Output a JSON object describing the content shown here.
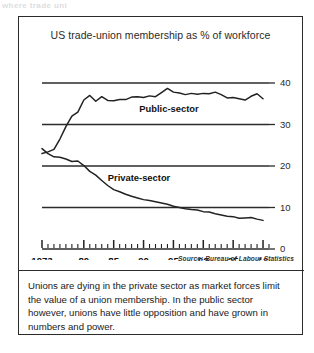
{
  "top_bleed_text": "where trade uni",
  "figure": {
    "title": "US trade-union membership as % of workforce",
    "source": "Source: Bureau of Labour Statistics",
    "caption": "Unions are dying in the private sector as market forces limit the value of a union membership. In the public sector however, unions have little opposition and have grown in numbers and power."
  },
  "colors": {
    "line": "#222222",
    "gridline": "#2b2b2b",
    "text": "#1a1a1a",
    "border": "#2b2b2b",
    "background": "#ffffff"
  },
  "chart_data": {
    "type": "line",
    "title": "US trade-union membership as % of workforce",
    "xlabel": "",
    "ylabel": "",
    "xlim": [
      1973,
      2011
    ],
    "ylim": [
      0,
      42
    ],
    "yticks": [
      0,
      10,
      20,
      30,
      40
    ],
    "ytick_labels": [
      "0",
      "10",
      "20",
      "30",
      "40"
    ],
    "grid": "horizontal-gridlines-at-yticks",
    "xticks_major": [
      1973,
      1980,
      1985,
      1990,
      1995,
      2000,
      2005,
      2010
    ],
    "xtick_labels": [
      "1973",
      "80",
      "85",
      "90",
      "95",
      "00",
      "05",
      "10"
    ],
    "xticks_minor_step": 1,
    "legend": "inline-labels",
    "series": [
      {
        "name": "Public-sector",
        "label_position": "inside-right-of-center",
        "x": [
          1973,
          1974,
          1975,
          1976,
          1977,
          1978,
          1979,
          1980,
          1981,
          1982,
          1983,
          1984,
          1985,
          1986,
          1987,
          1988,
          1989,
          1990,
          1991,
          1992,
          1993,
          1994,
          1995,
          1996,
          1997,
          1998,
          1999,
          2000,
          2001,
          2002,
          2003,
          2004,
          2005,
          2006,
          2007,
          2008,
          2009,
          2010
        ],
        "values": [
          23.0,
          23.4,
          24.0,
          26.5,
          29.5,
          32.0,
          33.0,
          35.9,
          37.0,
          35.6,
          36.7,
          35.8,
          35.7,
          36.0,
          36.0,
          36.6,
          36.7,
          36.5,
          36.9,
          36.7,
          37.7,
          38.7,
          37.8,
          37.6,
          37.2,
          37.5,
          37.3,
          37.5,
          37.4,
          37.8,
          37.2,
          36.4,
          36.5,
          36.2,
          35.9,
          36.8,
          37.4,
          36.2
        ]
      },
      {
        "name": "Private-sector",
        "label_position": "left-of-center",
        "x": [
          1973,
          1974,
          1975,
          1976,
          1977,
          1978,
          1979,
          1980,
          1981,
          1982,
          1983,
          1984,
          1985,
          1986,
          1987,
          1988,
          1989,
          1990,
          1991,
          1992,
          1993,
          1994,
          1995,
          1996,
          1997,
          1998,
          1999,
          2000,
          2001,
          2002,
          2003,
          2004,
          2005,
          2006,
          2007,
          2008,
          2009,
          2010
        ],
        "values": [
          24.2,
          23.0,
          22.2,
          22.1,
          21.7,
          21.1,
          21.2,
          20.1,
          18.7,
          17.8,
          16.5,
          15.3,
          14.3,
          13.8,
          13.2,
          12.7,
          12.3,
          11.9,
          11.7,
          11.4,
          11.1,
          10.8,
          10.3,
          10.0,
          9.7,
          9.5,
          9.4,
          9.0,
          8.9,
          8.5,
          8.2,
          7.9,
          7.8,
          7.4,
          7.5,
          7.6,
          7.2,
          6.9
        ]
      }
    ]
  }
}
